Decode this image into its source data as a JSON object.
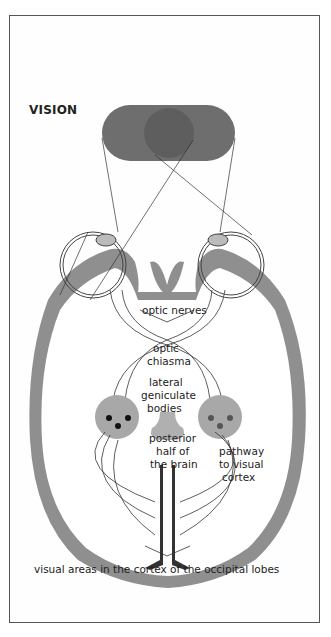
{
  "figure": {
    "title": "VISION",
    "labels": {
      "optic_nerves": "optic nerves",
      "optic_chiasma_1": "optic",
      "optic_chiasma_2": "chiasma",
      "lgb_1": "lateral",
      "lgb_2": "geniculate",
      "lgb_3": "bodies",
      "posterior_1": "posterior",
      "posterior_2": "half of",
      "posterior_3": "the brain",
      "pathway_1": "pathway",
      "pathway_2": "to visual",
      "pathway_3": "cortex",
      "visual_areas": "visual areas in the cortex of the occipital lobes"
    },
    "colors": {
      "visual_field": "#6e6e6e",
      "visual_field_overlap": "#5e5e5e",
      "cortex": "#9a9a9a",
      "lgb": "#a8a8a8",
      "frame": "#555555"
    }
  }
}
